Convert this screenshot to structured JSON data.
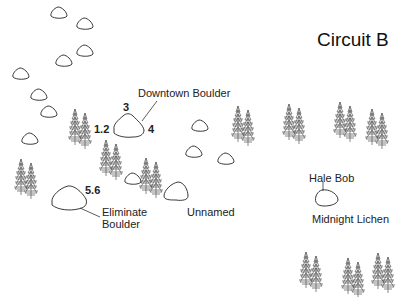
{
  "title": "Circuit B",
  "boulders": [
    {
      "name": "Downtown Boulder",
      "grades": [
        "1.2",
        "3",
        "4"
      ]
    },
    {
      "name": "Eliminate Boulder",
      "label_lines": [
        "Eliminate",
        "Boulder"
      ],
      "grades": [
        "5.6"
      ]
    },
    {
      "name": "Unnamed",
      "grades": []
    },
    {
      "name": "Hale Bob / Midnight Lichen",
      "labels": [
        "Hale Bob",
        "Midnight Lichen"
      ]
    }
  ],
  "labels": {
    "downtown": "Downtown Boulder",
    "downtown_grade_left": "1.2",
    "downtown_grade_top": "3",
    "downtown_grade_right": "4",
    "eliminate_line1": "Eliminate",
    "eliminate_line2": "Boulder",
    "eliminate_grade": "5.6",
    "unnamed": "Unnamed",
    "hale_bob": "Hale Bob",
    "midnight_lichen": "Midnight Lichen"
  },
  "icons": {
    "small_boulder": "rock-outline",
    "tree": "pine-tree-pair"
  }
}
